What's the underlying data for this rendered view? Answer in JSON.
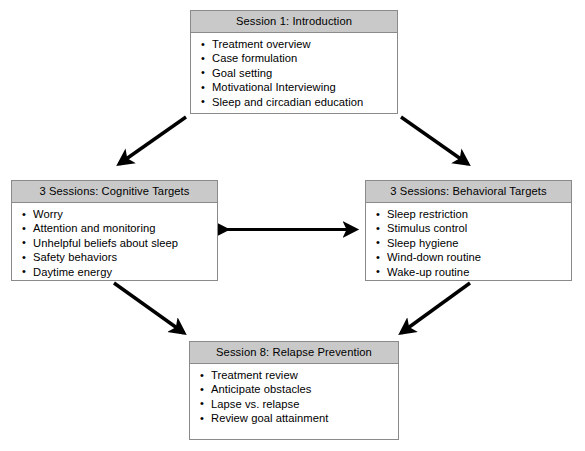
{
  "diagram": {
    "colors": {
      "header_fill": "#c9c9c9",
      "box_border": "#8a8a8a",
      "box_fill": "#ffffff",
      "arrow": "#000000",
      "background": "#ffffff"
    },
    "boxes": [
      {
        "id": "introduction",
        "header": "Session 1: Introduction",
        "items": [
          "Treatment overview",
          "Case formulation",
          "Goal setting",
          "Motivational Interviewing",
          "Sleep and circadian education"
        ]
      },
      {
        "id": "cognitive-targets",
        "header": "3 Sessions: Cognitive Targets",
        "items": [
          "Worry",
          "Attention and monitoring",
          "Unhelpful beliefs about sleep",
          "Safety behaviors",
          "Daytime energy"
        ]
      },
      {
        "id": "behavioral-targets",
        "header": "3 Sessions: Behavioral Targets",
        "items": [
          "Sleep restriction",
          "Stimulus control",
          "Sleep hygiene",
          "Wind-down routine",
          "Wake-up routine"
        ]
      },
      {
        "id": "relapse-prevention",
        "header": "Session 8: Relapse Prevention",
        "items": [
          "Treatment review",
          "Anticipate obstacles",
          "Lapse vs. relapse",
          "Review goal attainment"
        ]
      }
    ],
    "arrows": [
      {
        "id": "introduction-to-cognitive",
        "from": "introduction",
        "to": "cognitive-targets",
        "direction": "single",
        "heads": 1
      },
      {
        "id": "introduction-to-behavioral",
        "from": "introduction",
        "to": "behavioral-targets",
        "direction": "single",
        "heads": 1
      },
      {
        "id": "cognitive-behavioral-bidirectional",
        "from": "cognitive-targets",
        "to": "behavioral-targets",
        "direction": "double",
        "heads": 2
      },
      {
        "id": "cognitive-to-relapse",
        "from": "cognitive-targets",
        "to": "relapse-prevention",
        "direction": "single",
        "heads": 1
      },
      {
        "id": "behavioral-to-relapse",
        "from": "behavioral-targets",
        "to": "relapse-prevention",
        "direction": "single",
        "heads": 1
      }
    ]
  }
}
